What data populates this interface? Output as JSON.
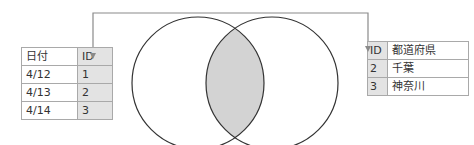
{
  "diagram": {
    "type": "inner-join-venn",
    "left_table": {
      "headers": [
        "日付",
        "ID"
      ],
      "key_column": "ID",
      "rows": [
        [
          "4/12",
          "1"
        ],
        [
          "4/13",
          "2"
        ],
        [
          "4/14",
          "3"
        ]
      ]
    },
    "right_table": {
      "headers": [
        "ID",
        "都道府県"
      ],
      "key_column": "ID",
      "rows": [
        [
          "2",
          "千葉"
        ],
        [
          "3",
          "神奈川"
        ]
      ]
    },
    "connector": {
      "description": "line linking left ID column to right ID column with arrowheads",
      "color": "#8a8a8a"
    },
    "venn": {
      "circles": 2,
      "intersection_fill": "#d3d3d3",
      "stroke": "#333333"
    },
    "colors": {
      "key_column_fill": "#e3e3e3",
      "table_border": "#a9a9a9"
    }
  }
}
